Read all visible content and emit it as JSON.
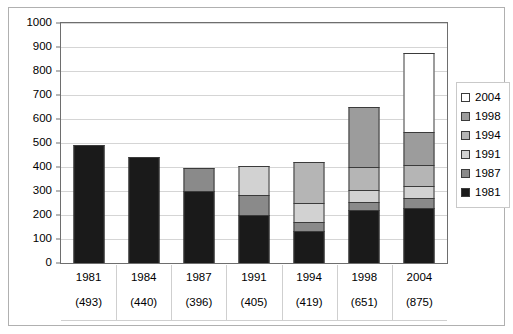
{
  "chart_data": {
    "type": "bar",
    "subtype": "stacked-bar",
    "title": "",
    "xlabel": "",
    "ylabel": "",
    "ylim": [
      0,
      1000
    ],
    "ytick_step": 100,
    "yticks": [
      0,
      100,
      200,
      300,
      400,
      500,
      600,
      700,
      800,
      900,
      1000
    ],
    "grid": true,
    "legend_position": "right",
    "categories": [
      "1981",
      "1984",
      "1987",
      "1991",
      "1994",
      "1998",
      "2004"
    ],
    "category_totals": [
      493,
      440,
      396,
      405,
      419,
      651,
      875
    ],
    "category_total_labels": [
      "(493)",
      "(440)",
      "(396)",
      "(405)",
      "(419)",
      "(651)",
      "(875)"
    ],
    "series": [
      {
        "name": "1981",
        "color": "#1a1a1a",
        "values": [
          493,
          440,
          300,
          200,
          135,
          220,
          230
        ]
      },
      {
        "name": "1987",
        "color": "#8a8a8a",
        "values": [
          0,
          0,
          96,
          85,
          35,
          35,
          40
        ]
      },
      {
        "name": "1991",
        "color": "#d2d2d2",
        "values": [
          0,
          0,
          0,
          120,
          80,
          50,
          50
        ]
      },
      {
        "name": "1994",
        "color": "#b5b5b5",
        "values": [
          0,
          0,
          0,
          0,
          169,
          95,
          90
        ]
      },
      {
        "name": "1998",
        "color": "#9c9c9c",
        "values": [
          0,
          0,
          0,
          0,
          0,
          251,
          135
        ]
      },
      {
        "name": "2004",
        "color": "#ffffff",
        "values": [
          0,
          0,
          0,
          0,
          0,
          0,
          330
        ]
      }
    ],
    "legend_entries": [
      {
        "label": "2004",
        "color": "#ffffff"
      },
      {
        "label": "1998",
        "color": "#9c9c9c"
      },
      {
        "label": "1994",
        "color": "#b5b5b5"
      },
      {
        "label": "1991",
        "color": "#d2d2d2"
      },
      {
        "label": "1987",
        "color": "#8a8a8a"
      },
      {
        "label": "1981",
        "color": "#1a1a1a"
      }
    ]
  },
  "axis": {
    "y_tick_labels": [
      "1000",
      "900",
      "800",
      "700",
      "600",
      "500",
      "400",
      "300",
      "200",
      "100",
      "0"
    ]
  },
  "colors": {
    "plot_border": "#6e6e6e",
    "frame_border": "#b0b0b0",
    "gridline": "#d5d5d5",
    "segment_border": "#3b3b3b",
    "background": "#ffffff"
  }
}
